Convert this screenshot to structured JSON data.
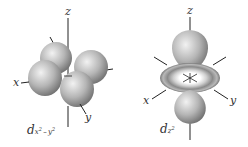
{
  "diagram": {
    "orbitals": [
      {
        "id": "dx2-y2",
        "label_main": "d",
        "label_sub": "x",
        "label_sup1": "2",
        "label_mid": " – y",
        "label_sup2": "2",
        "axes": {
          "z": "z",
          "x": "x",
          "y": "y"
        },
        "shape": "four-lobed cloverleaf along x and y axes"
      },
      {
        "id": "dz2",
        "label_main": "d",
        "label_sub": "z",
        "label_sup1": "2",
        "axes": {
          "z": "z",
          "x": "x",
          "y": "y"
        },
        "shape": "two lobes along z axis with torus in xy-plane"
      }
    ],
    "colors": {
      "lobe_light": "#e6e6e6",
      "lobe_dark": "#7a7a7a",
      "axis": "#222222",
      "label": "#333333"
    }
  }
}
